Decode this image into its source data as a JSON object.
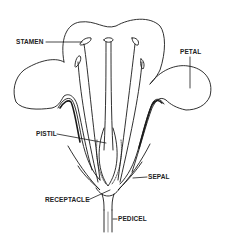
{
  "diagram": {
    "line_color": "#1a1a1a",
    "background": "#ffffff",
    "labels": {
      "stamen": "STAMEN",
      "petal": "PETAL",
      "pistil": "PISTIL",
      "sepal": "SEPAL",
      "receptacle": "RECEPTACLE",
      "pedicel": "PEDICEL"
    }
  }
}
